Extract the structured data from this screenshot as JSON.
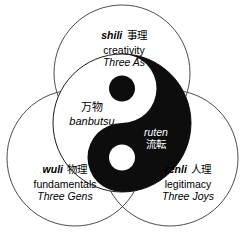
{
  "diagram": {
    "background_color": "#ffffff",
    "stroke_color": "#4d4d4d",
    "ink_color": "#000000",
    "reverse_ink_color": "#ffffff"
  },
  "circles": {
    "top": {
      "name": "shili",
      "term": "shili",
      "cjk": "事理",
      "english": "creativity",
      "triad": "Three As"
    },
    "bottom_left": {
      "name": "wuli",
      "term": "wuli",
      "cjk": "物理",
      "english": "fundamentals",
      "triad": "Three Gens"
    },
    "bottom_right": {
      "name": "renli",
      "term": "renli",
      "cjk": "人理",
      "english": "legitimacy",
      "triad": "Three Joys"
    }
  },
  "center": {
    "yin_label": {
      "cjk": "万物",
      "romaji": "banbutsu"
    },
    "yang_label": {
      "romaji": "ruten",
      "cjk": "流転"
    }
  }
}
